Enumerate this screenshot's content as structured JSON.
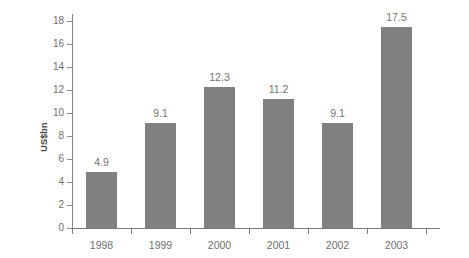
{
  "chart_data": {
    "type": "bar",
    "title": "",
    "xlabel": "",
    "ylabel": "US$bn",
    "categories": [
      "1998",
      "1999",
      "2000",
      "2001",
      "2002",
      "2003"
    ],
    "values": [
      4.9,
      9.1,
      12.3,
      11.2,
      9.1,
      17.5
    ],
    "value_labels": [
      "4.9",
      "9.1",
      "12.3",
      "11.2",
      "9.1",
      "17.5"
    ],
    "ylim": [
      0,
      18
    ],
    "ytick_labels": [
      "0",
      "2",
      "4",
      "6",
      "8",
      "10",
      "12",
      "14",
      "16",
      "18"
    ],
    "ytick_values": [
      0,
      2,
      4,
      6,
      8,
      10,
      12,
      14,
      16,
      18
    ],
    "grid": false,
    "legend": null,
    "series": [
      {
        "name": "US$bn",
        "values": [
          4.9,
          9.1,
          12.3,
          11.2,
          9.1,
          17.5
        ]
      }
    ],
    "colors": {
      "bar_fill": "#808080",
      "axis": "#7a7a7a",
      "tick_label": "#6f6f6f",
      "value_label": "#747474",
      "axis_title": "#444444",
      "background": "#ffffff"
    }
  }
}
